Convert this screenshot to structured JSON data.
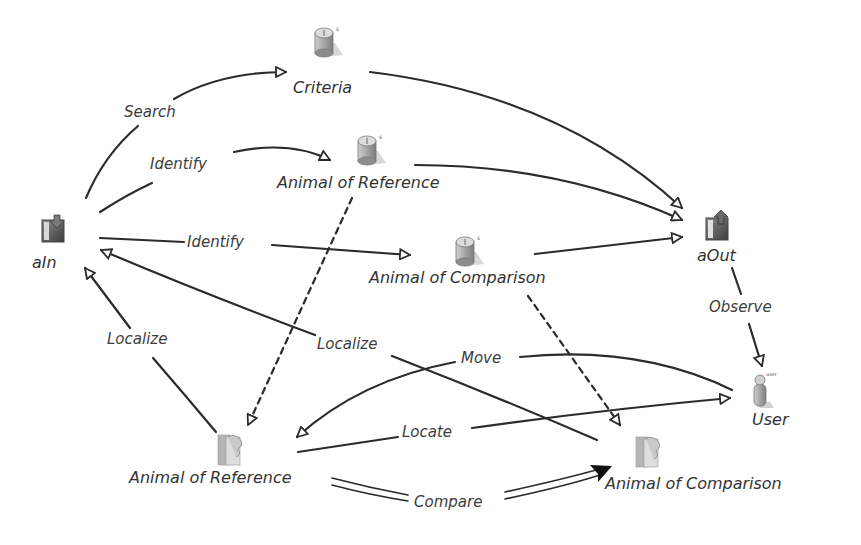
{
  "diagram": {
    "type": "activity-flow",
    "nodes": [
      {
        "id": "aIn",
        "label": "aIn",
        "icon": "input-port-icon"
      },
      {
        "id": "criteria",
        "label": "Criteria",
        "icon": "resource-cylinder-icon"
      },
      {
        "id": "animal_ref_top",
        "label": "Animal of Reference",
        "icon": "resource-cylinder-icon"
      },
      {
        "id": "animal_cmp_top",
        "label": "Animal of Comparison",
        "icon": "resource-cylinder-icon"
      },
      {
        "id": "aOut",
        "label": "aOut",
        "icon": "output-port-icon"
      },
      {
        "id": "user",
        "label": "User",
        "icon": "user-icon"
      },
      {
        "id": "animal_ref_bottom",
        "label": "Animal of Reference",
        "icon": "animal-document-icon"
      },
      {
        "id": "animal_cmp_bottom",
        "label": "Animal of Comparison",
        "icon": "animal-document-icon"
      }
    ],
    "edges": [
      {
        "label": "Search",
        "from": "aIn",
        "to": "criteria",
        "style": "solid"
      },
      {
        "label": "Identify",
        "from": "aIn",
        "to": "animal_ref_top",
        "style": "solid"
      },
      {
        "label": "Identify",
        "from": "aIn",
        "to": "animal_cmp_top",
        "style": "solid"
      },
      {
        "label": "",
        "from": "criteria",
        "to": "aOut",
        "style": "solid"
      },
      {
        "label": "",
        "from": "animal_ref_top",
        "to": "aOut",
        "style": "solid"
      },
      {
        "label": "",
        "from": "animal_cmp_top",
        "to": "aOut",
        "style": "solid"
      },
      {
        "label": "Observe",
        "from": "aOut",
        "to": "user",
        "style": "solid"
      },
      {
        "label": "Localize",
        "from": "animal_ref_bottom",
        "to": "aIn",
        "style": "solid"
      },
      {
        "label": "Localize",
        "from": "animal_cmp_bottom",
        "to": "aIn",
        "style": "solid"
      },
      {
        "label": "Move",
        "from": "user",
        "to": "animal_ref_bottom",
        "style": "solid"
      },
      {
        "label": "Locate",
        "from": "animal_ref_bottom",
        "to": "user",
        "style": "solid"
      },
      {
        "label": "Compare",
        "from": "animal_ref_bottom",
        "to": "animal_cmp_bottom",
        "style": "double"
      },
      {
        "label": "",
        "from": "animal_ref_top",
        "to": "animal_ref_bottom",
        "style": "dashed"
      },
      {
        "label": "",
        "from": "animal_cmp_top",
        "to": "animal_cmp_bottom",
        "style": "dashed"
      }
    ]
  },
  "labels": {
    "aIn": "aIn",
    "criteria": "Criteria",
    "animal_ref_top": "Animal of Reference",
    "animal_cmp_top": "Animal of Comparison",
    "aOut": "aOut",
    "user": "User",
    "animal_ref_bottom": "Animal of Reference",
    "animal_cmp_bottom": "Animal of Comparison",
    "edge_search": "Search",
    "edge_identify_ref": "Identify",
    "edge_identify_cmp": "Identify",
    "edge_observe": "Observe",
    "edge_localize_left": "Localize",
    "edge_localize_mid": "Localize",
    "edge_move": "Move",
    "edge_locate": "Locate",
    "edge_compare": "Compare"
  },
  "colors": {
    "line": "#2b2b2b",
    "text": "#3a3a3a",
    "icon_gray": "#9a9a9a",
    "background": "#ffffff"
  }
}
